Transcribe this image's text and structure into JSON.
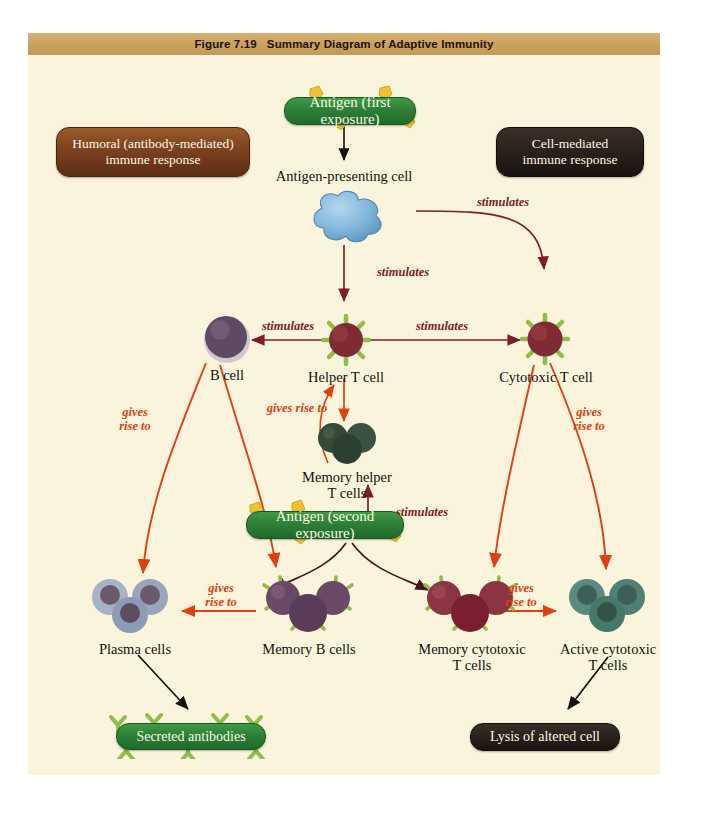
{
  "figure": {
    "title": "Figure 7.19   Summary Diagram of Adaptive Immunity",
    "background_color": "#fbf4dc",
    "titlebar_color": "#caa05c"
  },
  "pathway_labels": {
    "humoral": "Humoral (antibody-mediated)\nimmune response",
    "humoral_color": "#7e4420",
    "cell_mediated": "Cell-mediated\nimmune response",
    "cell_mediated_color": "#2a221c"
  },
  "antigen_boxes": {
    "first": "Antigen (first exposure)",
    "second": "Antigen (second exposure)",
    "color": "#2e8038"
  },
  "outcome_boxes": {
    "antibodies": "Secreted antibodies",
    "antibodies_color": "#2e8038",
    "lysis": "Lysis of altered cell",
    "lysis_color": "#2a221c"
  },
  "cells": [
    {
      "id": "apc",
      "label": "Antigen-presenting cell",
      "color": "#7fb4d8"
    },
    {
      "id": "b-cell",
      "label": "B cell",
      "color": "#5e4a63"
    },
    {
      "id": "helper-t",
      "label": "Helper T cell",
      "color": "#7e2b33"
    },
    {
      "id": "cytotoxic-t",
      "label": "Cytotoxic T cell",
      "color": "#7e2b33"
    },
    {
      "id": "memory-helper-t",
      "label": "Memory helper\nT cells",
      "color": "#344a36"
    },
    {
      "id": "plasma",
      "label": "Plasma cells",
      "color": "#8e9bb4"
    },
    {
      "id": "memory-b",
      "label": "Memory B cells",
      "color": "#6b4a67"
    },
    {
      "id": "memory-cyto-t",
      "label": "Memory cytotoxic\nT cells",
      "color": "#8b3442"
    },
    {
      "id": "active-cyto-t",
      "label": "Active cytotoxic\nT cells",
      "color": "#4f7d72"
    }
  ],
  "arrow_labels": {
    "stimulates": "stimulates",
    "gives_rise_to": "gives rise to",
    "gives_rise_to_wrapped": "gives\nrise to",
    "stimulates_color": "#7d1f22",
    "gives_rise_to_color": "#e0400f"
  },
  "arrows": [
    {
      "from": "antigen-first",
      "to": "apc",
      "relation": ""
    },
    {
      "from": "apc",
      "to": "helper-t",
      "relation": "stimulates"
    },
    {
      "from": "apc",
      "to": "cytotoxic-t",
      "relation": "stimulates"
    },
    {
      "from": "helper-t",
      "to": "b-cell",
      "relation": "stimulates"
    },
    {
      "from": "helper-t",
      "to": "cytotoxic-t",
      "relation": "stimulates"
    },
    {
      "from": "helper-t",
      "to": "memory-helper-t",
      "relation": "gives rise to"
    },
    {
      "from": "b-cell",
      "to": "plasma",
      "relation": "gives rise to"
    },
    {
      "from": "b-cell",
      "to": "memory-b",
      "relation": "gives rise to"
    },
    {
      "from": "cytotoxic-t",
      "to": "memory-cyto-t",
      "relation": "gives rise to"
    },
    {
      "from": "cytotoxic-t",
      "to": "active-cyto-t",
      "relation": "gives rise to"
    },
    {
      "from": "antigen-second",
      "to": "memory-helper-t",
      "relation": "stimulates"
    },
    {
      "from": "antigen-second",
      "to": "memory-b",
      "relation": ""
    },
    {
      "from": "antigen-second",
      "to": "memory-cyto-t",
      "relation": ""
    },
    {
      "from": "memory-b",
      "to": "plasma",
      "relation": "gives rise to"
    },
    {
      "from": "memory-cyto-t",
      "to": "active-cyto-t",
      "relation": "gives rise to"
    },
    {
      "from": "plasma",
      "to": "secreted-antibodies",
      "relation": ""
    },
    {
      "from": "active-cyto-t",
      "to": "lysis",
      "relation": ""
    }
  ]
}
